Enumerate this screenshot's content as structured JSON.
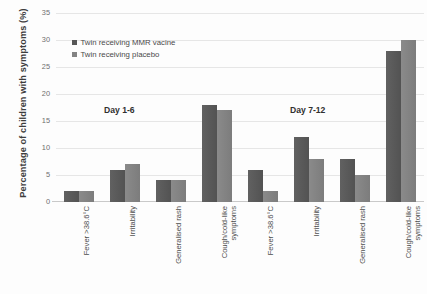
{
  "chart_data": {
    "type": "bar",
    "title": "",
    "xlabel": "",
    "ylabel": "Percentage of children with symptoms (%)",
    "ylim": [
      0,
      35
    ],
    "ytick_step": 5,
    "yticks": [
      0,
      5,
      10,
      15,
      20,
      25,
      30,
      35
    ],
    "grid": true,
    "legend_position": "top-left-inside",
    "categories": [
      "Fever >38.6°C",
      "Irritability",
      "Generalised rash",
      "Cough/cold-like symptoms",
      "Fever >38.6°C",
      "Irritability",
      "Generalised rash",
      "Cough/cold-like symptoms"
    ],
    "series": [
      {
        "name": "Twin receiving MMR vacine",
        "color": "#575757",
        "values": [
          2,
          6,
          4,
          18,
          6,
          12,
          8,
          28
        ]
      },
      {
        "name": "Twin receiving placebo",
        "color": "#838383",
        "values": [
          2,
          7,
          4,
          17,
          2,
          8,
          5,
          30
        ]
      }
    ],
    "annotations": [
      {
        "text": "Day 1-6",
        "group_span": [
          0,
          3
        ]
      },
      {
        "text": "Day 7-12",
        "group_span": [
          4,
          7
        ]
      }
    ]
  },
  "axes": {
    "y_title": "Percentage of children with symptoms (%)",
    "y_tick_labels": [
      "0",
      "5",
      "10",
      "15",
      "20",
      "25",
      "30",
      "35"
    ]
  },
  "legend": {
    "items": [
      {
        "label": "Twin receiving MMR vacine",
        "color": "#575757"
      },
      {
        "label": "Twin receiving placebo",
        "color": "#838383"
      }
    ]
  },
  "annotations": {
    "day_labels": [
      "Day 1-6",
      "Day 7-12"
    ]
  },
  "colors": {
    "series_mmr": "#575757",
    "series_placebo": "#838383",
    "gridline": "#e6e6e6",
    "axis": "#c9c9c9",
    "background": "#fdfdfd",
    "text": "#4a4a4a"
  }
}
